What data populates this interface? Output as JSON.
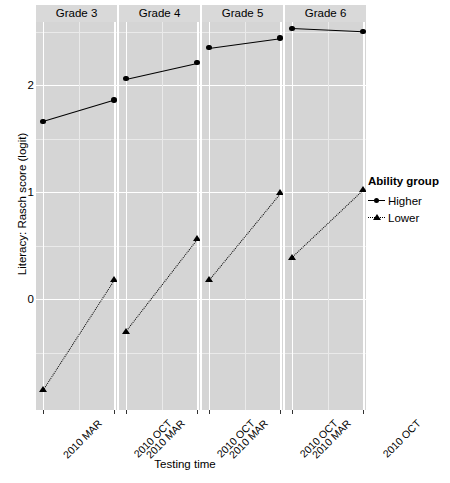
{
  "chart_data": {
    "type": "line",
    "title": "",
    "xlabel": "Testing time",
    "ylabel": "Literacy: Rasch score (logit)",
    "legend_title": "Ability group",
    "legend_position": "right",
    "grid": true,
    "facet_labels": [
      "Grade 3",
      "Grade 4",
      "Grade 5",
      "Grade 6"
    ],
    "x_tick_labels": [
      "2010 MAR",
      "2010 OCT",
      "2010 MAR",
      "2010 OCT",
      "2010 MAR",
      "2010 OCT",
      "2010 MAR",
      "2010 OCT"
    ],
    "y_tick_labels": [
      "0",
      "1",
      "2"
    ],
    "y_ticks": [
      0,
      1,
      2
    ],
    "ylim": [
      -1.05,
      2.75
    ],
    "categories": [
      "2010 MAR",
      "2010 OCT"
    ],
    "series": [
      {
        "name": "Higher",
        "marker": "circle",
        "linestyle": "solid",
        "color": "#000000",
        "values_by_facet": {
          "Grade 3": [
            1.66,
            1.86
          ],
          "Grade 4": [
            2.06,
            2.21
          ],
          "Grade 5": [
            2.35,
            2.44
          ],
          "Grade 6": [
            2.53,
            2.5
          ]
        }
      },
      {
        "name": "Lower",
        "marker": "triangle",
        "linestyle": "dotted",
        "color": "#000000",
        "values_by_facet": {
          "Grade 3": [
            -0.85,
            0.18
          ],
          "Grade 4": [
            -0.3,
            0.56
          ],
          "Grade 5": [
            0.18,
            0.99
          ],
          "Grade 6": [
            0.39,
            1.02
          ]
        }
      }
    ]
  },
  "axes": {
    "y_title": "Literacy: Rasch score (logit)",
    "x_title": "Testing time"
  },
  "legend": {
    "title": "Ability group",
    "items": [
      {
        "label": "Higher",
        "key": "solid-line-circle-key"
      },
      {
        "label": "Lower",
        "key": "dotted-line-triangle-key"
      }
    ]
  },
  "colors": {
    "panel_background": "#d5d5d5",
    "strip_background": "#d9d9d9",
    "major_gridline": "#ffffff",
    "minor_gridline": "#eaeaea",
    "mark": "#000000",
    "plot_background": "#ffffff"
  }
}
